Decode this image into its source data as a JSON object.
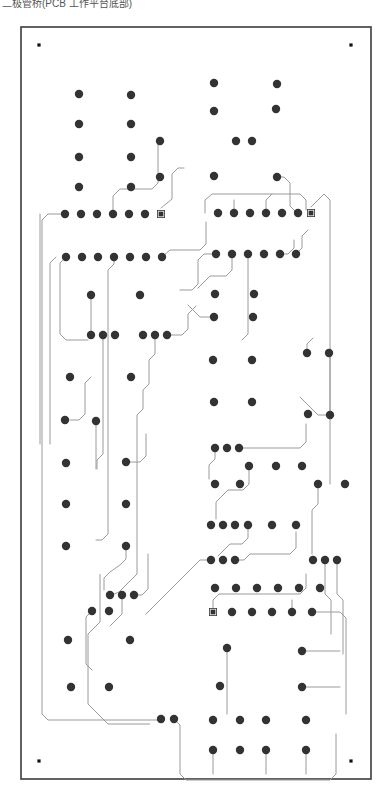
{
  "caption": {
    "text": "二极管桥(PCB 工作平台底部)"
  },
  "figure": {
    "board_outline_label": "board-outline",
    "colors": {
      "background": "#ffffff",
      "board_border": "#3b3b3b",
      "pad": "#333333",
      "trace": "#9a9a9a",
      "fiducial": "#111111",
      "caption_text": "#555555"
    },
    "geometry": {
      "board_x": 21,
      "board_y": 13,
      "board_width": 350,
      "board_height": 752,
      "board_border_width": 1.6,
      "pad_radius": 4.2,
      "small_pad_radius": 3.0,
      "square_pad_size": 8.0,
      "fiducial_size": 3.2,
      "trace_width": 1.0
    },
    "fiducials": [
      {
        "name": "fiducial-top-left",
        "x": 39,
        "y": 31
      },
      {
        "name": "fiducial-top-right",
        "x": 351,
        "y": 31
      },
      {
        "name": "fiducial-bottom-left",
        "x": 39,
        "y": 747
      },
      {
        "name": "fiducial-bottom-right",
        "x": 351,
        "y": 747
      }
    ],
    "square_pads": [
      {
        "name": "pin1-header-left-top",
        "x": 161,
        "y": 200
      },
      {
        "name": "pin1-header-right-top",
        "x": 311,
        "y": 199
      },
      {
        "name": "pin1-header-bottom",
        "x": 213,
        "y": 598
      }
    ],
    "pads": [
      {
        "x": 79,
        "y": 80
      },
      {
        "x": 131,
        "y": 81
      },
      {
        "x": 79,
        "y": 110
      },
      {
        "x": 131,
        "y": 110
      },
      {
        "x": 160,
        "y": 127
      },
      {
        "x": 79,
        "y": 143
      },
      {
        "x": 131,
        "y": 143
      },
      {
        "x": 79,
        "y": 173
      },
      {
        "x": 131,
        "y": 173
      },
      {
        "x": 160,
        "y": 163
      },
      {
        "x": 65,
        "y": 200
      },
      {
        "x": 81,
        "y": 200
      },
      {
        "x": 97,
        "y": 200
      },
      {
        "x": 113,
        "y": 200
      },
      {
        "x": 129,
        "y": 200
      },
      {
        "x": 145,
        "y": 200
      },
      {
        "x": 66,
        "y": 243
      },
      {
        "x": 82,
        "y": 243
      },
      {
        "x": 98,
        "y": 243
      },
      {
        "x": 114,
        "y": 243
      },
      {
        "x": 130,
        "y": 243
      },
      {
        "x": 146,
        "y": 243
      },
      {
        "x": 162,
        "y": 243
      },
      {
        "x": 91,
        "y": 281
      },
      {
        "x": 140,
        "y": 281
      },
      {
        "x": 91,
        "y": 321
      },
      {
        "x": 103,
        "y": 321
      },
      {
        "x": 115,
        "y": 321
      },
      {
        "x": 143,
        "y": 321
      },
      {
        "x": 155,
        "y": 321
      },
      {
        "x": 167,
        "y": 321
      },
      {
        "x": 70,
        "y": 363
      },
      {
        "x": 131,
        "y": 363
      },
      {
        "x": 65,
        "y": 406
      },
      {
        "x": 96,
        "y": 407
      },
      {
        "x": 66,
        "y": 449
      },
      {
        "x": 126,
        "y": 448
      },
      {
        "x": 66,
        "y": 490
      },
      {
        "x": 126,
        "y": 490
      },
      {
        "x": 66,
        "y": 532
      },
      {
        "x": 126,
        "y": 532
      },
      {
        "x": 110,
        "y": 581
      },
      {
        "x": 122,
        "y": 581
      },
      {
        "x": 134,
        "y": 581
      },
      {
        "x": 92,
        "y": 597
      },
      {
        "x": 109,
        "y": 597
      },
      {
        "x": 68,
        "y": 626
      },
      {
        "x": 130,
        "y": 626
      },
      {
        "x": 71,
        "y": 673
      },
      {
        "x": 109,
        "y": 673
      },
      {
        "x": 214,
        "y": 69
      },
      {
        "x": 277,
        "y": 70
      },
      {
        "x": 214,
        "y": 97
      },
      {
        "x": 276,
        "y": 95
      },
      {
        "x": 236,
        "y": 127
      },
      {
        "x": 252,
        "y": 127
      },
      {
        "x": 214,
        "y": 162
      },
      {
        "x": 277,
        "y": 163
      },
      {
        "x": 218,
        "y": 199
      },
      {
        "x": 234,
        "y": 199
      },
      {
        "x": 250,
        "y": 199
      },
      {
        "x": 266,
        "y": 199
      },
      {
        "x": 282,
        "y": 199
      },
      {
        "x": 298,
        "y": 199
      },
      {
        "x": 216,
        "y": 240
      },
      {
        "x": 232,
        "y": 240
      },
      {
        "x": 248,
        "y": 240
      },
      {
        "x": 264,
        "y": 240
      },
      {
        "x": 280,
        "y": 240
      },
      {
        "x": 296,
        "y": 240
      },
      {
        "x": 215,
        "y": 280
      },
      {
        "x": 254,
        "y": 280
      },
      {
        "x": 214,
        "y": 303
      },
      {
        "x": 253,
        "y": 303
      },
      {
        "x": 307,
        "y": 339
      },
      {
        "x": 329,
        "y": 339
      },
      {
        "x": 213,
        "y": 346
      },
      {
        "x": 252,
        "y": 346
      },
      {
        "x": 214,
        "y": 388
      },
      {
        "x": 252,
        "y": 388
      },
      {
        "x": 308,
        "y": 400
      },
      {
        "x": 330,
        "y": 401
      },
      {
        "x": 215,
        "y": 434
      },
      {
        "x": 227,
        "y": 434
      },
      {
        "x": 239,
        "y": 434
      },
      {
        "x": 249,
        "y": 452
      },
      {
        "x": 276,
        "y": 452
      },
      {
        "x": 302,
        "y": 452
      },
      {
        "x": 215,
        "y": 470
      },
      {
        "x": 240,
        "y": 470
      },
      {
        "x": 318,
        "y": 470
      },
      {
        "x": 345,
        "y": 470
      },
      {
        "x": 211,
        "y": 511
      },
      {
        "x": 223,
        "y": 511
      },
      {
        "x": 235,
        "y": 511
      },
      {
        "x": 248,
        "y": 511
      },
      {
        "x": 272,
        "y": 511
      },
      {
        "x": 296,
        "y": 511
      },
      {
        "x": 211,
        "y": 546
      },
      {
        "x": 223,
        "y": 546
      },
      {
        "x": 235,
        "y": 546
      },
      {
        "x": 313,
        "y": 546
      },
      {
        "x": 325,
        "y": 546
      },
      {
        "x": 337,
        "y": 546
      },
      {
        "x": 215,
        "y": 574
      },
      {
        "x": 236,
        "y": 574
      },
      {
        "x": 257,
        "y": 574
      },
      {
        "x": 278,
        "y": 574
      },
      {
        "x": 299,
        "y": 574
      },
      {
        "x": 320,
        "y": 574
      },
      {
        "x": 232,
        "y": 598
      },
      {
        "x": 252,
        "y": 598
      },
      {
        "x": 272,
        "y": 598
      },
      {
        "x": 292,
        "y": 598
      },
      {
        "x": 312,
        "y": 598
      },
      {
        "x": 227,
        "y": 634
      },
      {
        "x": 302,
        "y": 637
      },
      {
        "x": 220,
        "y": 672
      },
      {
        "x": 302,
        "y": 673
      },
      {
        "x": 161,
        "y": 705
      },
      {
        "x": 174,
        "y": 705
      },
      {
        "x": 213,
        "y": 706
      },
      {
        "x": 240,
        "y": 706
      },
      {
        "x": 266,
        "y": 706
      },
      {
        "x": 306,
        "y": 706
      },
      {
        "x": 213,
        "y": 736
      },
      {
        "x": 240,
        "y": 736
      },
      {
        "x": 266,
        "y": 736
      },
      {
        "x": 306,
        "y": 736
      }
    ],
    "traces": [
      "M 40 200 L 40 420 L 40 430",
      "M 65 200 L 48 200 L 42 206 L 42 700 L 48 706 L 160 706",
      "M 113 200 L 113 182 L 120 175 L 152 175 L 158 169 L 158 130",
      "M 161 194 L 172 185 L 172 160 L 178 154 L 184 154",
      "M 56 243 L 50 249 L 50 430",
      "M 66 243 L 60 249 L 60 320 L 66 326 L 88 326",
      "M 162 243 L 170 236 L 200 236 L 206 230 L 206 208",
      "M 114 243 L 114 250 L 108 256 L 108 520 L 102 526 L 96 526",
      "M 103 321 L 103 440 L 97 446 L 97 455",
      "M 91 281 L 91 320",
      "M 91 363 L 85 369 L 85 400 L 79 406 L 70 406",
      "M 96 407 L 96 455",
      "M 167 321 L 182 321 L 188 315 L 188 300 L 196 292",
      "M 155 321 L 155 340 L 149 346 L 149 370 L 143 376 L 143 395 L 137 401 L 137 560 L 131 566 L 125 572 L 119 578 L 112 581",
      "M 126 448 L 140 448 L 146 442 L 146 420",
      "M 126 532 L 126 545 L 120 551 L 110 558 L 104 564 L 104 576",
      "M 122 581 L 122 600 L 116 606 L 110 612",
      "M 134 581 L 142 581 L 148 575 L 148 540",
      "M 92 597 L 86 603 L 86 650 L 92 656",
      "M 205 199 L 205 186 L 212 180 L 300 180 L 306 186 L 306 196",
      "M 234 199 L 234 186",
      "M 266 199 L 266 186 L 272 180",
      "M 277 163 L 284 163 L 290 169 L 290 192 L 296 198",
      "M 311 193 L 318 186 L 324 180 L 330 186 L 330 400",
      "M 216 240 L 204 240 L 198 246 L 198 270 L 192 276 L 180 276",
      "M 232 240 L 232 256 L 226 262 L 210 262 L 204 268 L 198 274",
      "M 248 240 L 248 320 L 242 326",
      "M 296 240 L 302 234 L 302 222 L 308 216",
      "M 280 240 L 288 240 L 294 234 L 294 226",
      "M 214 303 L 200 303 L 194 297 L 188 291",
      "M 330 339 L 330 470",
      "M 307 339 L 307 330 L 313 324",
      "M 330 401 L 318 401 L 312 395 L 306 389 L 300 383",
      "M 215 434 L 215 445 L 209 451 L 209 465",
      "M 239 434 L 300 434 L 306 428 L 306 410",
      "M 249 452 L 249 470 L 243 476 L 228 476 L 222 482 L 216 488 L 216 505",
      "M 318 470 L 318 490 L 312 496 L 312 540",
      "M 248 511 L 248 524 L 242 530 L 230 530 L 224 536 L 218 542",
      "M 235 546 L 244 546 L 250 540 L 290 540 L 296 534 L 296 518",
      "M 211 546 L 200 546 L 194 552 L 188 558 L 182 564 L 176 570 L 170 576 L 164 582 L 158 588 L 152 594 L 146 600",
      "M 325 546 L 325 580 L 331 586 L 331 620",
      "M 337 546 L 337 580 L 343 586 L 343 640",
      "M 213 598 L 213 586 L 219 580 L 300 580 L 306 574 L 306 560",
      "M 292 598 L 292 586",
      "M 312 598 L 340 598 L 346 604 L 346 700",
      "M 302 637 L 340 637",
      "M 302 673 L 340 673",
      "M 227 634 L 227 700",
      "M 174 705 L 180 711 L 180 760 L 186 766 L 330 766 L 336 760 L 336 720",
      "M 213 736 L 213 760",
      "M 266 736 L 266 760",
      "M 306 736 L 306 760"
    ],
    "ground_outline": "M 150 710 L 108 710 L 88 690 L 88 620 L 100 608 L 100 560"
  }
}
